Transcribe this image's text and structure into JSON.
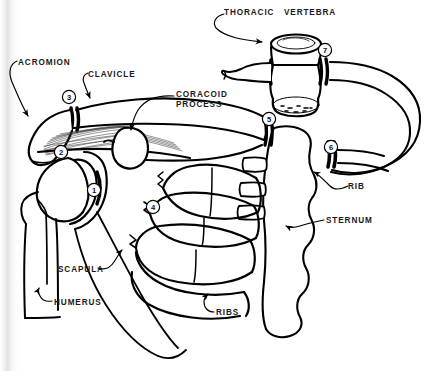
{
  "diagram": {
    "style": "black ink line art on white paper",
    "ink_color": "#000000",
    "paper_color": "#ffffff"
  },
  "labels": [
    {
      "id": "thoracic-vertebra",
      "text": "THORACIC   VERTEBRA",
      "x": 224,
      "y": 8,
      "leader": "curved line to vertebral body top"
    },
    {
      "id": "acromion",
      "text": "ACROMION",
      "x": 18,
      "y": 58,
      "leader": "curved line down to acromion tip"
    },
    {
      "id": "clavicle",
      "text": "CLAVICLE",
      "x": 88,
      "y": 70,
      "leader": "short hook to clavicle shaft"
    },
    {
      "id": "coracoid-process",
      "text": "CORACOID\nPROCESS",
      "x": 176,
      "y": 90,
      "leader": "line to coracoid blob"
    },
    {
      "id": "rib",
      "text": "RIB",
      "x": 348,
      "y": 182,
      "leader": "hook to sixth rib arc"
    },
    {
      "id": "sternum",
      "text": "STERNUM",
      "x": 326,
      "y": 216,
      "leader": "hook to sternum body"
    },
    {
      "id": "scapula",
      "text": "SCAPULA",
      "x": 58,
      "y": 265,
      "leader": "line up-right to scapula blade"
    },
    {
      "id": "humerus",
      "text": "HUMERUS",
      "x": 54,
      "y": 298,
      "leader": "short hook to humeral shaft"
    },
    {
      "id": "ribs",
      "text": "RIBS",
      "x": 216,
      "y": 308,
      "leader": "hook to lowest rib"
    }
  ],
  "markers": [
    {
      "id": "marker-1",
      "number": "1",
      "x": 94,
      "y": 190,
      "refers_to": "glenohumeral joint"
    },
    {
      "id": "marker-2",
      "number": "2",
      "x": 61,
      "y": 152,
      "refers_to": "acromiohumeral space"
    },
    {
      "id": "marker-3",
      "number": "3",
      "x": 69,
      "y": 97,
      "refers_to": "acromioclavicular joint"
    },
    {
      "id": "marker-4",
      "number": "4",
      "x": 153,
      "y": 207,
      "refers_to": "costochondral junction"
    },
    {
      "id": "marker-5",
      "number": "5",
      "x": 269,
      "y": 119,
      "refers_to": "sternoclavicular joint"
    },
    {
      "id": "marker-6",
      "number": "6",
      "x": 331,
      "y": 147,
      "refers_to": "sternocostal joint"
    },
    {
      "id": "marker-7",
      "number": "7",
      "x": 325,
      "y": 50,
      "refers_to": "costovertebral joint"
    }
  ],
  "structures": [
    {
      "id": "thoracic-vertebra-body",
      "name": "thoracic vertebra"
    },
    {
      "id": "clavicle-shaft",
      "name": "clavicle"
    },
    {
      "id": "acromion-process",
      "name": "acromion"
    },
    {
      "id": "coracoid-process-blob",
      "name": "coracoid process"
    },
    {
      "id": "humerus-bone",
      "name": "humerus"
    },
    {
      "id": "scapula-blade",
      "name": "scapula"
    },
    {
      "id": "sternum-body",
      "name": "sternum"
    },
    {
      "id": "rib-arcs",
      "name": "ribs"
    },
    {
      "id": "ligament-hatching",
      "name": "coracoacromial ligament"
    }
  ]
}
